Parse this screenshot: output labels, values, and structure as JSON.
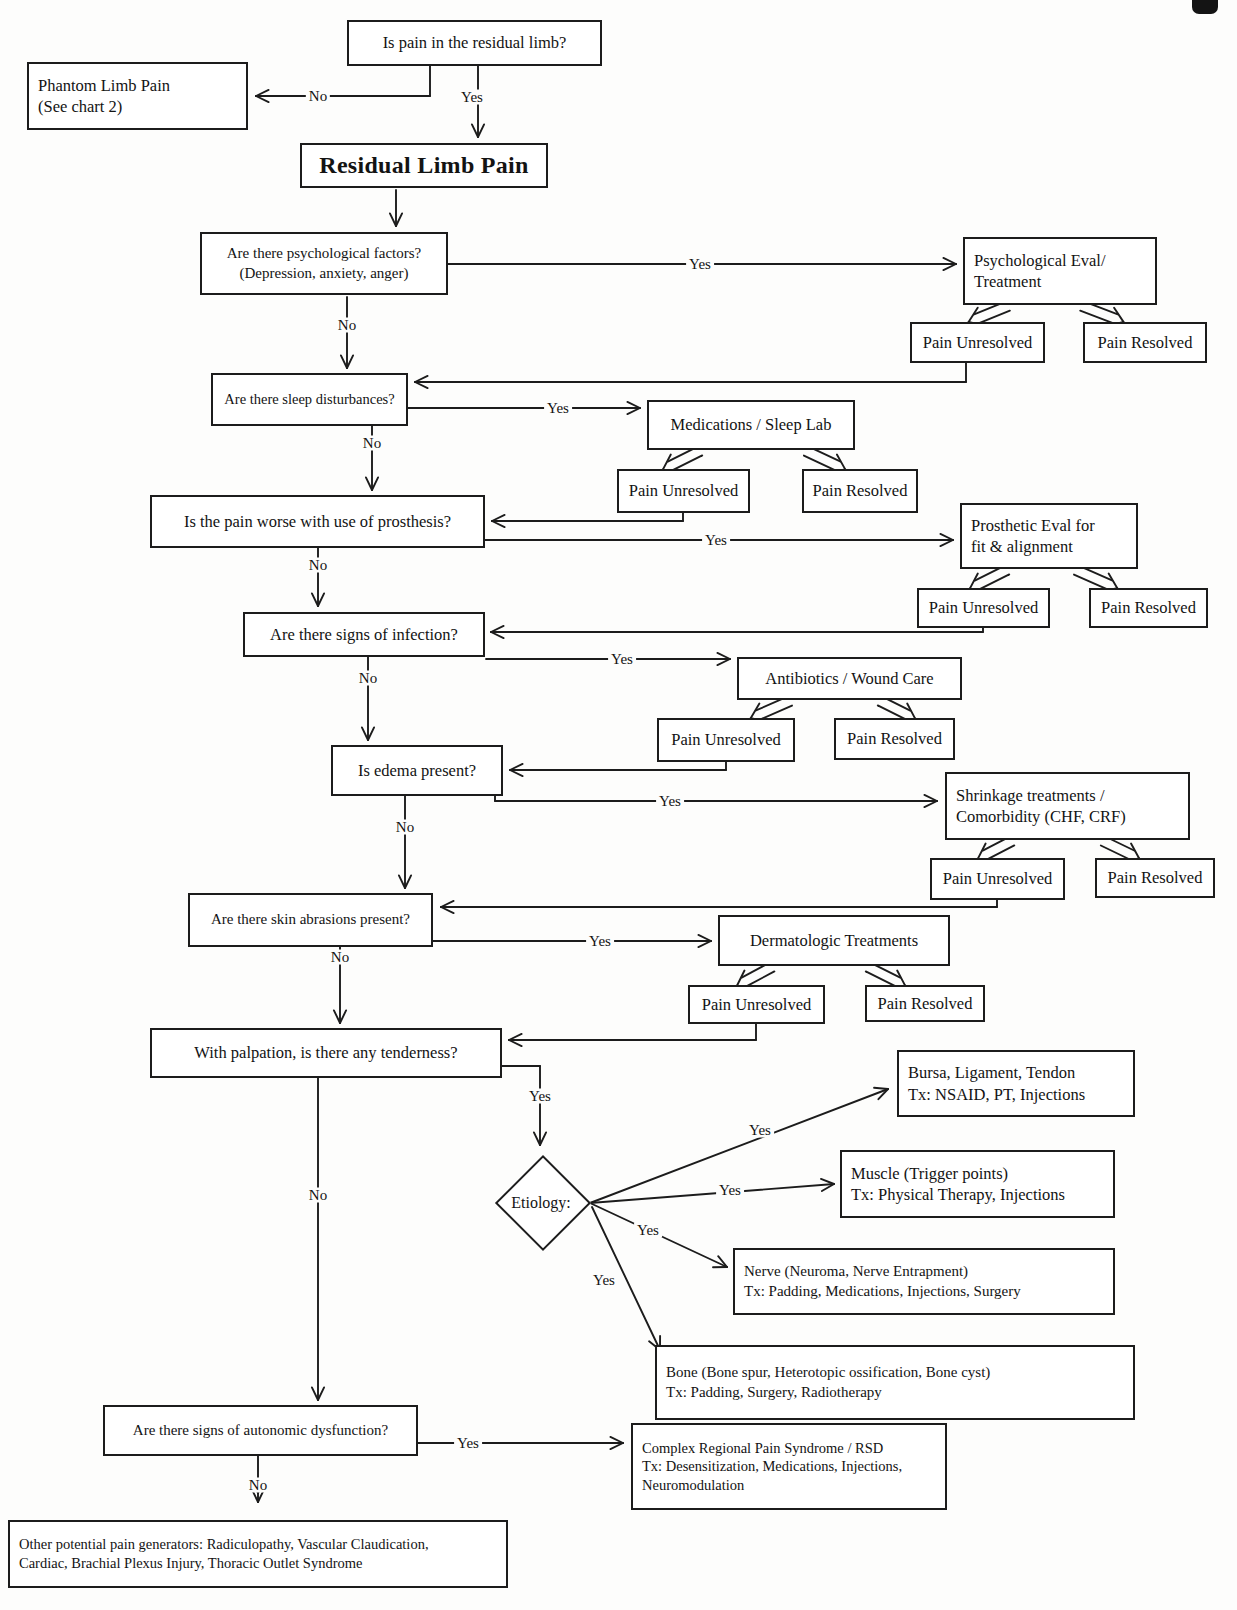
{
  "labels": {
    "yes": "Yes",
    "no": "No"
  },
  "outcomes": {
    "unresolved": "Pain Unresolved",
    "resolved": "Pain Resolved"
  },
  "nodes": {
    "q_residual": "Is pain in the residual limb?",
    "phantom": "Phantom Limb Pain\n(See chart 2)",
    "rlp": "Residual Limb Pain",
    "q_psych": "Are there psychological factors?\n(Depression, anxiety, anger)",
    "psych_eval": "Psychological Eval/\nTreatment",
    "q_sleep": "Are there sleep disturbances?",
    "meds_sleep": "Medications / Sleep Lab",
    "q_prosthesis": "Is the pain worse with use of prosthesis?",
    "prosth_eval": "Prosthetic Eval for\nfit & alignment",
    "q_infection": "Are there signs of infection?",
    "antibiotics": "Antibiotics / Wound Care",
    "q_edema": "Is edema present?",
    "shrinkage": "Shrinkage treatments /\nComorbidity (CHF, CRF)",
    "q_abrasions": "Are there skin abrasions present?",
    "derm": "Dermatologic Treatments",
    "q_palpation": "With palpation, is there any tenderness?",
    "etiology": "Etiology:",
    "bursa": "Bursa, Ligament, Tendon\nTx: NSAID, PT, Injections",
    "muscle": "Muscle (Trigger points)\nTx: Physical Therapy, Injections",
    "nerve": "Nerve (Neuroma, Nerve Entrapment)\nTx: Padding, Medications, Injections, Surgery",
    "bone": "Bone (Bone spur, Heterotopic ossification, Bone cyst)\nTx: Padding, Surgery, Radiotherapy",
    "q_autonomic": "Are there signs of autonomic dysfunction?",
    "crps": "Complex Regional Pain Syndrome / RSD\nTx: Desensitization, Medications, Injections,\nNeuromodulation",
    "other": "Other potential pain generators: Radiculopathy, Vascular Claudication,\nCardiac, Brachial Plexus Injury, Thoracic Outlet Syndrome"
  }
}
